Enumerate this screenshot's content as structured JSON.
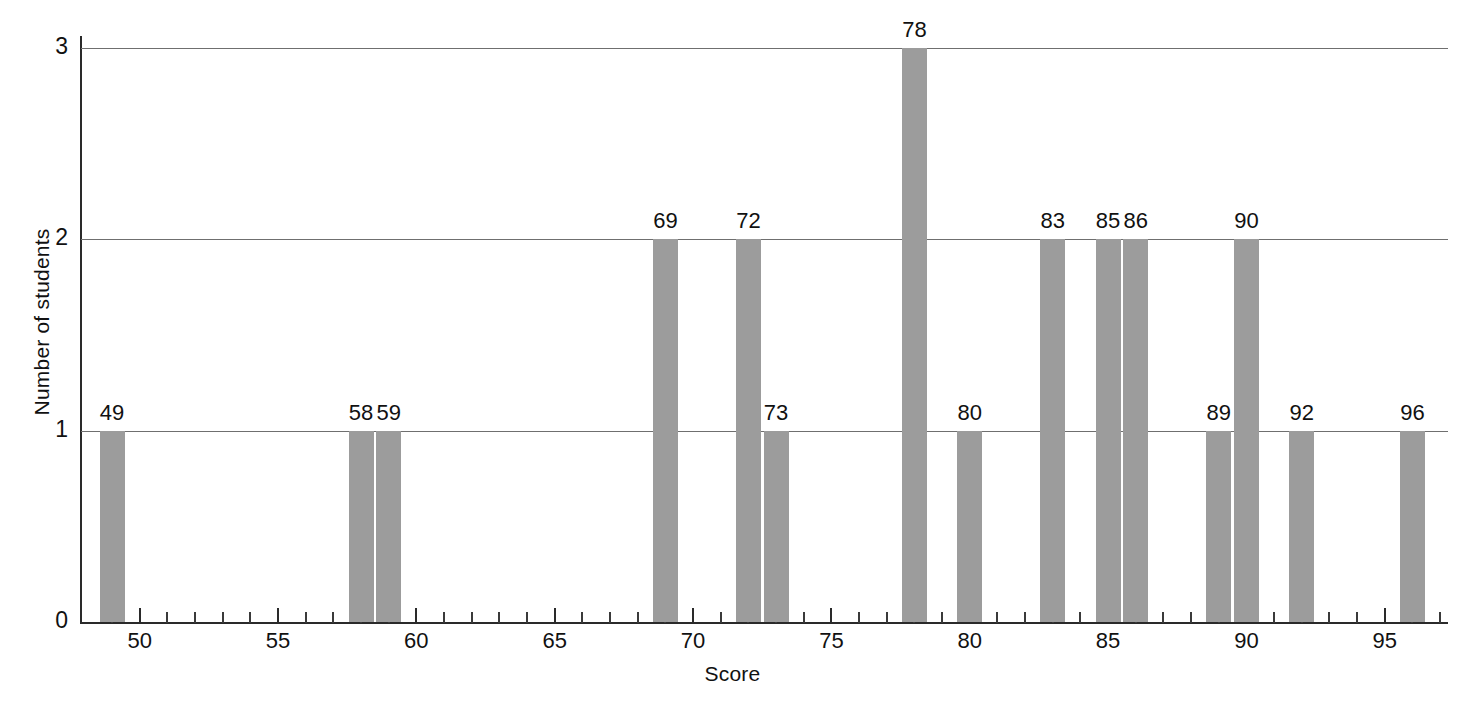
{
  "chart_data": {
    "type": "bar",
    "title": "",
    "subtitle": "",
    "xlabel": "Score",
    "ylabel": "Number of students",
    "xlim": [
      48.3,
      97.4
    ],
    "ylim": [
      0,
      3
    ],
    "grid": "horizontal",
    "legend": "none",
    "bar_color": "#9c9c9c",
    "x_major_ticks": [
      50,
      55,
      60,
      65,
      70,
      75,
      80,
      85,
      90,
      95
    ],
    "x_major_tick_labels": [
      "50",
      "55",
      "60",
      "65",
      "70",
      "75",
      "80",
      "85",
      "90",
      "95"
    ],
    "x_minor_tick_step": 1,
    "y_ticks": [
      0,
      1,
      2,
      3
    ],
    "y_tick_labels": [
      "0",
      "1",
      "2",
      "3"
    ],
    "categories": [
      49,
      58,
      59,
      69,
      72,
      73,
      78,
      80,
      83,
      85,
      86,
      89,
      90,
      92,
      96
    ],
    "values": [
      1,
      1,
      1,
      2,
      2,
      1,
      3,
      1,
      2,
      2,
      2,
      1,
      2,
      1,
      1
    ],
    "data_labels": [
      "49",
      "58",
      "59",
      "69",
      "72",
      "73",
      "78",
      "80",
      "83",
      "85",
      "86",
      "89",
      "90",
      "92",
      "96"
    ],
    "annotations": "Each bar is labeled above with its score value; bar height equals the number of students achieving that score."
  }
}
